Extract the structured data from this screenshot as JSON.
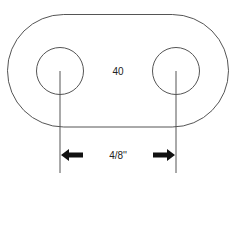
{
  "diagram": {
    "center_label": "40",
    "dimension_label": "4/8''",
    "stroke_color": "#555555",
    "arrow_color": "#111111",
    "shapes": {
      "stadium": {
        "x": 7.5,
        "y": 14.5,
        "width": 221,
        "height": 112.5
      },
      "left_hole": {
        "cx": 60,
        "cy": 71,
        "r": 23.5
      },
      "right_hole": {
        "cx": 176,
        "cy": 71,
        "r": 23.5
      },
      "extension_lines": [
        {
          "x": 60,
          "y1": 71,
          "y2": 173
        },
        {
          "x": 176,
          "y1": 71,
          "y2": 173
        }
      ],
      "arrows": [
        {
          "direction": "left",
          "x": 60,
          "y": 155
        },
        {
          "direction": "right",
          "x": 176,
          "y": 155
        }
      ]
    }
  }
}
